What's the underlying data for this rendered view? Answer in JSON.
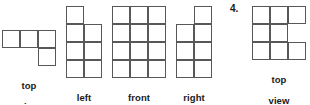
{
  "page": {
    "background_color": "#ffffff",
    "line_color": "#58585a",
    "text_color": "#1a1a1a",
    "cell_size_px": 18
  },
  "problem_left": {
    "figures": [
      {
        "id": "top-view",
        "caption": "top\nview",
        "caption_line1": "top",
        "caption_line2": "view",
        "grid_cols": 3,
        "grid_rows": 2,
        "filled_cells": [
          [
            0,
            0
          ],
          [
            0,
            1
          ],
          [
            0,
            2
          ],
          [
            1,
            2
          ]
        ]
      },
      {
        "id": "left-view",
        "caption": "left\nview",
        "caption_line1": "left",
        "caption_line2": "view",
        "grid_cols": 2,
        "grid_rows": 4,
        "filled_cells": [
          [
            0,
            0
          ],
          [
            1,
            0
          ],
          [
            1,
            1
          ],
          [
            2,
            0
          ],
          [
            2,
            1
          ],
          [
            3,
            0
          ],
          [
            3,
            1
          ]
        ]
      },
      {
        "id": "front-view",
        "caption": "front\nview",
        "caption_line1": "front",
        "caption_line2": "view",
        "grid_cols": 3,
        "grid_rows": 4,
        "filled_cells": [
          [
            0,
            0
          ],
          [
            0,
            1
          ],
          [
            0,
            2
          ],
          [
            1,
            0
          ],
          [
            1,
            1
          ],
          [
            1,
            2
          ],
          [
            2,
            0
          ],
          [
            2,
            1
          ],
          [
            2,
            2
          ],
          [
            3,
            0
          ],
          [
            3,
            1
          ],
          [
            3,
            2
          ]
        ]
      },
      {
        "id": "right-view",
        "caption": "right\nview",
        "caption_line1": "right",
        "caption_line2": "view",
        "grid_cols": 2,
        "grid_rows": 4,
        "filled_cells": [
          [
            0,
            1
          ],
          [
            1,
            0
          ],
          [
            1,
            1
          ],
          [
            2,
            0
          ],
          [
            2,
            1
          ],
          [
            3,
            0
          ],
          [
            3,
            1
          ]
        ]
      }
    ]
  },
  "problem_right": {
    "number_label": "4.",
    "figures": [
      {
        "id": "p4-top-view",
        "caption": "top\nview",
        "caption_line1": "top",
        "caption_line2": "view",
        "grid_cols": 3,
        "grid_rows": 3,
        "filled_cells": [
          [
            0,
            0
          ],
          [
            0,
            1
          ],
          [
            0,
            2
          ],
          [
            1,
            0
          ],
          [
            1,
            1
          ],
          [
            2,
            0
          ],
          [
            2,
            1
          ],
          [
            2,
            2
          ]
        ]
      }
    ]
  }
}
